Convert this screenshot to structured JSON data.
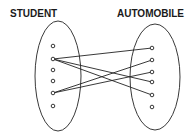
{
  "left_set": {
    "label": "STUDENT",
    "elements": 6
  },
  "right_set": {
    "label": "AUTOMOBILE",
    "elements": 6
  },
  "mappings": [
    {
      "from": 2,
      "to": 1
    },
    {
      "from": 2,
      "to": 4
    },
    {
      "from": 2,
      "to": 5
    },
    {
      "from": 5,
      "to": 2
    },
    {
      "from": 5,
      "to": 3
    }
  ],
  "colors": {
    "stroke": "#222222",
    "background": "#ffffff"
  }
}
